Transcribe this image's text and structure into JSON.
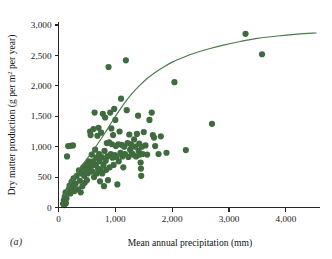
{
  "figure": {
    "panel_label": "(a)",
    "background_color": "#ffffff",
    "marker_color": "#3f6b3e",
    "curve_color": "#4a7a4c",
    "axis_color": "#262626"
  },
  "chart_data": {
    "type": "scatter",
    "title": "",
    "xlabel": "Mean annual precipitation (mm)",
    "ylabel_parts": {
      "before": "Dry matter production (g per m",
      "superscript": "2",
      "after": " per year)"
    },
    "ylabel": "Dry matter production (g per m2 per year)",
    "xlim": [
      0,
      4600
    ],
    "ylim": [
      0,
      3050
    ],
    "xticks": [
      0,
      1000,
      2000,
      3000,
      4000
    ],
    "xticklabels": [
      "0",
      "1,000",
      "2,000",
      "3,000",
      "4,000"
    ],
    "yticks": [
      0,
      500,
      1000,
      1500,
      2000,
      2500,
      3000
    ],
    "yticklabels": [
      "0",
      "500",
      "1,000",
      "1,500",
      "2,000",
      "2,500",
      "3,000"
    ],
    "grid": false,
    "legend": null,
    "marker_size": 3.1,
    "points": [
      [
        80,
        60
      ],
      [
        95,
        120
      ],
      [
        100,
        40
      ],
      [
        110,
        180
      ],
      [
        115,
        95
      ],
      [
        125,
        250
      ],
      [
        130,
        70
      ],
      [
        140,
        150
      ],
      [
        150,
        840
      ],
      [
        170,
        1010
      ],
      [
        215,
        1015
      ],
      [
        255,
        1020
      ],
      [
        180,
        300
      ],
      [
        195,
        360
      ],
      [
        210,
        230
      ],
      [
        230,
        420
      ],
      [
        250,
        330
      ],
      [
        265,
        480
      ],
      [
        280,
        270
      ],
      [
        300,
        390
      ],
      [
        320,
        520
      ],
      [
        340,
        300
      ],
      [
        360,
        610
      ],
      [
        375,
        440
      ],
      [
        390,
        250
      ],
      [
        405,
        560
      ],
      [
        420,
        350
      ],
      [
        435,
        660
      ],
      [
        450,
        520
      ],
      [
        460,
        405
      ],
      [
        475,
        600
      ],
      [
        490,
        700
      ],
      [
        500,
        450
      ],
      [
        515,
        560
      ],
      [
        530,
        760
      ],
      [
        545,
        640
      ],
      [
        555,
        1250
      ],
      [
        565,
        1190
      ],
      [
        575,
        680
      ],
      [
        585,
        870
      ],
      [
        595,
        590
      ],
      [
        605,
        760
      ],
      [
        615,
        1290
      ],
      [
        625,
        500
      ],
      [
        635,
        1560
      ],
      [
        645,
        950
      ],
      [
        655,
        700
      ],
      [
        665,
        820
      ],
      [
        675,
        560
      ],
      [
        685,
        1180
      ],
      [
        695,
        640
      ],
      [
        705,
        1310
      ],
      [
        715,
        880
      ],
      [
        720,
        760
      ],
      [
        730,
        430
      ],
      [
        740,
        620
      ],
      [
        750,
        1230
      ],
      [
        760,
        830
      ],
      [
        770,
        560
      ],
      [
        780,
        1540
      ],
      [
        790,
        700
      ],
      [
        800,
        350
      ],
      [
        810,
        930
      ],
      [
        820,
        1480
      ],
      [
        830,
        770
      ],
      [
        840,
        620
      ],
      [
        850,
        1060
      ],
      [
        860,
        840
      ],
      [
        870,
        450
      ],
      [
        880,
        2310
      ],
      [
        890,
        1070
      ],
      [
        900,
        660
      ],
      [
        910,
        1560
      ],
      [
        920,
        880
      ],
      [
        930,
        1300
      ],
      [
        940,
        1040
      ],
      [
        950,
        820
      ],
      [
        960,
        1190
      ],
      [
        970,
        700
      ],
      [
        980,
        1620
      ],
      [
        990,
        860
      ],
      [
        1000,
        1440
      ],
      [
        1010,
        1010
      ],
      [
        1020,
        830
      ],
      [
        1035,
        380
      ],
      [
        1050,
        1040
      ],
      [
        1060,
        760
      ],
      [
        1075,
        1250
      ],
      [
        1090,
        900
      ],
      [
        1100,
        1790
      ],
      [
        1110,
        1030
      ],
      [
        1125,
        840
      ],
      [
        1140,
        660
      ],
      [
        1155,
        1000
      ],
      [
        1170,
        880
      ],
      [
        1185,
        2420
      ],
      [
        1200,
        1600
      ],
      [
        1215,
        1060
      ],
      [
        1230,
        830
      ],
      [
        1245,
        1200
      ],
      [
        1260,
        950
      ],
      [
        1275,
        1040
      ],
      [
        1290,
        890
      ],
      [
        1310,
        870
      ],
      [
        1330,
        1120
      ],
      [
        1350,
        1000
      ],
      [
        1365,
        840
      ],
      [
        1380,
        1210
      ],
      [
        1400,
        1510
      ],
      [
        1410,
        930
      ],
      [
        1420,
        1050
      ],
      [
        1435,
        870
      ],
      [
        1445,
        740
      ],
      [
        1450,
        640
      ],
      [
        1455,
        520
      ],
      [
        1465,
        1000
      ],
      [
        1480,
        880
      ],
      [
        1500,
        1240
      ],
      [
        1530,
        1020
      ],
      [
        1560,
        870
      ],
      [
        1600,
        1440
      ],
      [
        1640,
        1560
      ],
      [
        1660,
        1190
      ],
      [
        1680,
        1150
      ],
      [
        1700,
        1010
      ],
      [
        1760,
        880
      ],
      [
        1800,
        1170
      ],
      [
        1900,
        900
      ],
      [
        2040,
        2060
      ],
      [
        2240,
        945
      ],
      [
        2700,
        1375
      ],
      [
        3290,
        2855
      ],
      [
        3580,
        2520
      ]
    ],
    "fit_curve": {
      "description": "saturating asymptotic fit",
      "x_start": 80,
      "x_end": 4530,
      "points": [
        [
          80,
          160
        ],
        [
          200,
          380
        ],
        [
          320,
          570
        ],
        [
          450,
          740
        ],
        [
          580,
          900
        ],
        [
          700,
          1060
        ],
        [
          820,
          1230
        ],
        [
          940,
          1410
        ],
        [
          1060,
          1580
        ],
        [
          1180,
          1740
        ],
        [
          1300,
          1880
        ],
        [
          1420,
          2000
        ],
        [
          1560,
          2120
        ],
        [
          1700,
          2220
        ],
        [
          1850,
          2310
        ],
        [
          2000,
          2390
        ],
        [
          2200,
          2470
        ],
        [
          2400,
          2540
        ],
        [
          2650,
          2610
        ],
        [
          2900,
          2670
        ],
        [
          3200,
          2730
        ],
        [
          3500,
          2780
        ],
        [
          3850,
          2820
        ],
        [
          4200,
          2850
        ],
        [
          4530,
          2870
        ]
      ]
    }
  }
}
